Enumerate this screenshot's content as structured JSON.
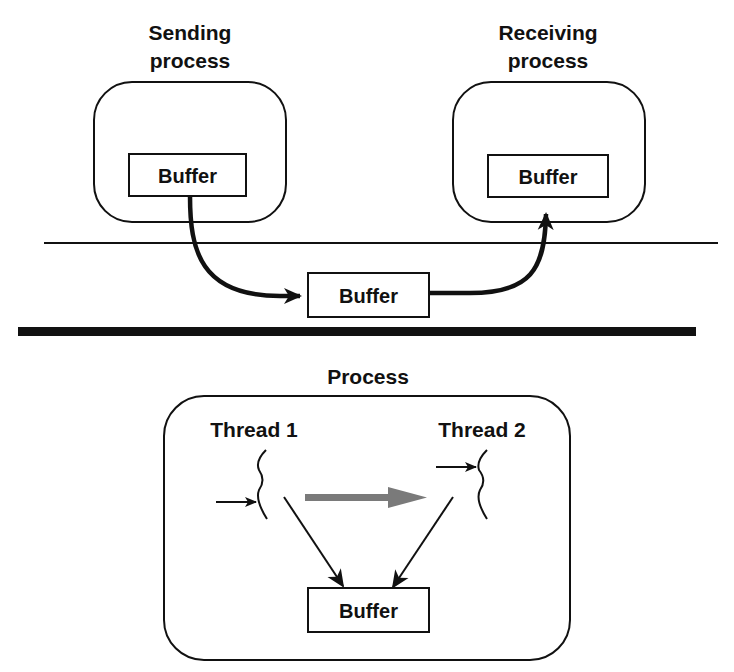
{
  "top_panel": {
    "sending_process": {
      "title_line1": "Sending",
      "title_line2": "process",
      "buffer_label": "Buffer"
    },
    "receiving_process": {
      "title_line1": "Receiving",
      "title_line2": "process",
      "buffer_label": "Buffer"
    },
    "kernel_buffer_label": "Buffer"
  },
  "bottom_panel": {
    "process_title": "Process",
    "thread1_label": "Thread 1",
    "thread2_label": "Thread 2",
    "shared_buffer_label": "Buffer"
  },
  "colors": {
    "ink": "#111111",
    "gray_arrow": "#7a7a7a",
    "background": "#ffffff"
  }
}
